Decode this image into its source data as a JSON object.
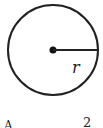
{
  "diagram": {
    "shape": "circle",
    "radius_label": "r",
    "formula_partial": "A",
    "formula_exponent": "2"
  }
}
